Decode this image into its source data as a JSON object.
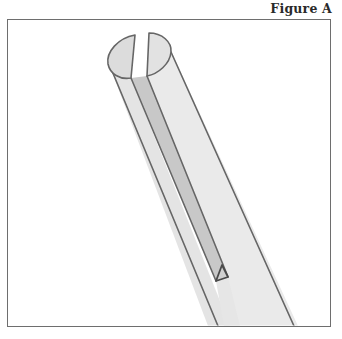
{
  "figure": {
    "caption": "Figure A",
    "colors": {
      "outline": "#666666",
      "tube_face": "#e6e6e6",
      "tube_face_light": "#ececec",
      "slot_face": "#c9c9c9",
      "cap_face": "#dedede",
      "background": "#ffffff",
      "frame": "#6e6e6e"
    }
  }
}
